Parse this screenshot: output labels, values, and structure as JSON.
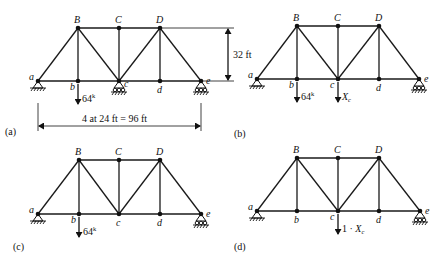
{
  "figure": {
    "panels": [
      {
        "id": "a",
        "label": "(a)",
        "label_pos": [
          5,
          135
        ],
        "nodes": {
          "a": [
            38,
            81
          ],
          "b": [
            78,
            81
          ],
          "c": [
            119,
            81
          ],
          "d": [
            160,
            81
          ],
          "e": [
            201,
            81
          ],
          "B": [
            78,
            28
          ],
          "C": [
            119,
            28
          ],
          "D": [
            160,
            28
          ]
        },
        "node_label_offsets": {
          "a": [
            -9,
            -1
          ],
          "b": [
            -8,
            9
          ],
          "c": [
            5,
            6
          ],
          "d": [
            -3,
            12
          ],
          "e": [
            5,
            3
          ],
          "B": [
            -4,
            -5
          ],
          "C": [
            -4,
            -5
          ],
          "D": [
            -4,
            -5
          ]
        },
        "supports": [
          {
            "node": "a",
            "type": "pin"
          },
          {
            "node": "c",
            "type": "roller"
          },
          {
            "node": "e",
            "type": "roller"
          }
        ],
        "loads": [
          {
            "node": "b",
            "text": "64",
            "sup": "k",
            "length": 20
          }
        ]
      },
      {
        "id": "b",
        "label": "(b)",
        "label_pos": [
          234,
          137
        ],
        "nodes": {
          "a": [
            257,
            79
          ],
          "b": [
            297,
            79
          ],
          "c": [
            338,
            79
          ],
          "d": [
            379,
            79
          ],
          "e": [
            419,
            79
          ],
          "B": [
            297,
            26
          ],
          "C": [
            338,
            26
          ],
          "D": [
            379,
            26
          ]
        },
        "node_label_offsets": {
          "a": [
            -9,
            -1
          ],
          "b": [
            -8,
            9
          ],
          "c": [
            -8,
            9
          ],
          "d": [
            -3,
            12
          ],
          "e": [
            5,
            3
          ],
          "B": [
            -4,
            -5
          ],
          "C": [
            -4,
            -5
          ],
          "D": [
            -4,
            -5
          ]
        },
        "supports": [
          {
            "node": "a",
            "type": "pin"
          },
          {
            "node": "e",
            "type": "roller"
          }
        ],
        "loads": [
          {
            "node": "b",
            "text": "64",
            "sup": "k",
            "length": 20
          },
          {
            "node": "c",
            "text": "X",
            "sub": "c",
            "length": 20
          }
        ]
      },
      {
        "id": "c",
        "label": "(c)",
        "label_pos": [
          13,
          250
        ],
        "nodes": {
          "a": [
            38,
            214
          ],
          "b": [
            79,
            214
          ],
          "c": [
            119,
            214
          ],
          "d": [
            160,
            214
          ],
          "e": [
            201,
            214
          ],
          "B": [
            79,
            160
          ],
          "C": [
            119,
            160
          ],
          "D": [
            160,
            160
          ]
        },
        "node_label_offsets": {
          "a": [
            -9,
            -1
          ],
          "b": [
            -8,
            9
          ],
          "c": [
            -3,
            12
          ],
          "d": [
            -3,
            12
          ],
          "e": [
            5,
            3
          ],
          "B": [
            -4,
            -5
          ],
          "C": [
            -4,
            -5
          ],
          "D": [
            -4,
            -5
          ]
        },
        "supports": [
          {
            "node": "a",
            "type": "pin"
          },
          {
            "node": "e",
            "type": "roller"
          }
        ],
        "loads": [
          {
            "node": "b",
            "text": "64",
            "sup": "k",
            "length": 20
          }
        ]
      },
      {
        "id": "d",
        "label": "(d)",
        "label_pos": [
          234,
          250
        ],
        "nodes": {
          "a": [
            257,
            211
          ],
          "b": [
            297,
            211
          ],
          "c": [
            338,
            211
          ],
          "d": [
            379,
            211
          ],
          "e": [
            420,
            211
          ],
          "B": [
            297,
            158
          ],
          "C": [
            338,
            158
          ],
          "D": [
            379,
            158
          ]
        },
        "node_label_offsets": {
          "a": [
            -9,
            -1
          ],
          "b": [
            -3,
            12
          ],
          "c": [
            -8,
            9
          ],
          "d": [
            -3,
            12
          ],
          "e": [
            5,
            3
          ],
          "B": [
            -4,
            -5
          ],
          "C": [
            -4,
            -5
          ],
          "D": [
            -4,
            -5
          ]
        },
        "supports": [
          {
            "node": "a",
            "type": "pin"
          },
          {
            "node": "e",
            "type": "roller"
          }
        ],
        "loads": [
          {
            "node": "c",
            "text": "1 · X",
            "sub": "c",
            "length": 20
          }
        ]
      }
    ],
    "members": [
      [
        "a",
        "b"
      ],
      [
        "b",
        "c"
      ],
      [
        "c",
        "d"
      ],
      [
        "d",
        "e"
      ],
      [
        "B",
        "C"
      ],
      [
        "C",
        "D"
      ],
      [
        "a",
        "B"
      ],
      [
        "B",
        "b"
      ],
      [
        "B",
        "c"
      ],
      [
        "C",
        "c"
      ],
      [
        "c",
        "D"
      ],
      [
        "D",
        "d"
      ],
      [
        "D",
        "e"
      ]
    ],
    "dimensions": {
      "height": {
        "text": "32 ft",
        "x": 228,
        "y_top": 28,
        "y_bottom": 81,
        "text_pos": [
          233,
          58
        ]
      },
      "span": {
        "text": "4 at 24 ft = 96 ft",
        "y": 126,
        "x_left": 38,
        "x_right": 201,
        "text_pos": [
          82,
          122
        ],
        "ext_top": 103
      }
    }
  }
}
